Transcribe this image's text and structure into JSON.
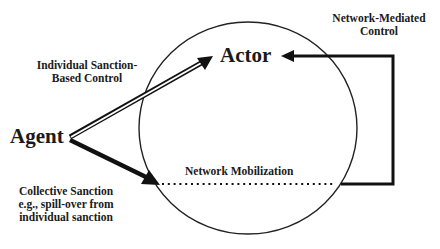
{
  "diagram": {
    "nodes": {
      "agent": {
        "label": "Agent"
      },
      "actor": {
        "label": "Actor"
      }
    },
    "edges": {
      "individual": {
        "line1": "Individual Sanction-",
        "line2": "Based Control"
      },
      "collective": {
        "line1": "Collective Sanction",
        "line2": "e.g., spill-over from",
        "line3": "individual sanction"
      },
      "network_mediated": {
        "line1": "Network-Mediated",
        "line2": "Control"
      },
      "network_mobilization": {
        "label": "Network Mobilization"
      }
    },
    "colors": {
      "stroke": "#111111",
      "background": "#ffffff"
    }
  }
}
